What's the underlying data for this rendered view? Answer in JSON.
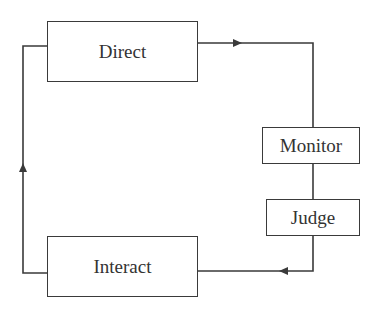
{
  "diagram": {
    "type": "feedback-loop",
    "nodes": [
      {
        "id": "direct",
        "label": "Direct"
      },
      {
        "id": "monitor",
        "label": "Monitor"
      },
      {
        "id": "judge",
        "label": "Judge"
      },
      {
        "id": "interact",
        "label": "Interact"
      }
    ],
    "edges": [
      {
        "from": "direct",
        "to": "monitor",
        "arrow": "right"
      },
      {
        "from": "monitor",
        "to": "judge",
        "arrow": "none"
      },
      {
        "from": "judge",
        "to": "interact",
        "arrow": "left"
      },
      {
        "from": "interact",
        "to": "direct",
        "arrow": "up"
      }
    ],
    "colors": {
      "line": "#3a3a3a",
      "text": "#333333",
      "background": "#ffffff"
    }
  }
}
